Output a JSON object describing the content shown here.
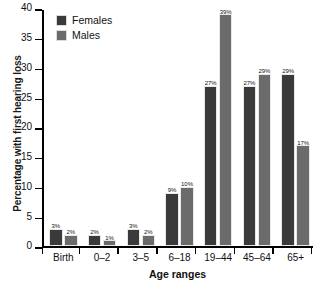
{
  "chart_data": {
    "type": "bar",
    "title": "",
    "xlabel": "Age ranges",
    "ylabel": "Percentage with first hearing loss",
    "categories": [
      "Birth",
      "0–2",
      "3–5",
      "6–18",
      "19–44",
      "45–64",
      "65+"
    ],
    "series": [
      {
        "name": "Females",
        "color": "#3a3a3a",
        "values": [
          3,
          2,
          3,
          9,
          27,
          27,
          29
        ],
        "labels": [
          "3%",
          "2%",
          "3%",
          "9%",
          "27%",
          "27%",
          "29%"
        ]
      },
      {
        "name": "Males",
        "color": "#6b6b6b",
        "values": [
          2,
          1,
          2,
          10,
          39,
          29,
          17
        ],
        "labels": [
          "2%",
          "1%",
          "2%",
          "10%",
          "39%",
          "29%",
          "17%"
        ]
      }
    ],
    "ylim": [
      0,
      40
    ],
    "yticks": [
      0,
      5,
      10,
      15,
      20,
      25,
      30,
      35,
      40
    ],
    "ytick_labels": [
      "0",
      "5",
      "10",
      "15",
      "20",
      "25",
      "30",
      "35",
      "40"
    ],
    "grid": false,
    "legend_position": "top-left"
  },
  "legend": {
    "items": [
      {
        "label": "Females",
        "swatch": "female-swatch"
      },
      {
        "label": "Males",
        "swatch": "male-swatch"
      }
    ]
  }
}
